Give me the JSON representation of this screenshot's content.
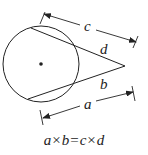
{
  "diagram": {
    "colors": {
      "stroke": "#222222",
      "background": "#ffffff"
    },
    "circle": {
      "cx": 41,
      "cy": 64,
      "r": 38,
      "has_center_dot": true
    },
    "vertex": {
      "x": 125,
      "y": 66
    },
    "labels": {
      "c": "c",
      "d": "d",
      "b": "b",
      "a": "a"
    },
    "formula": {
      "lhs_1": "a",
      "op_1": "×",
      "lhs_2": "b",
      "eq": "=",
      "rhs_1": "c",
      "op_2": "×",
      "rhs_2": "d",
      "text": "a × b = c × d"
    }
  }
}
